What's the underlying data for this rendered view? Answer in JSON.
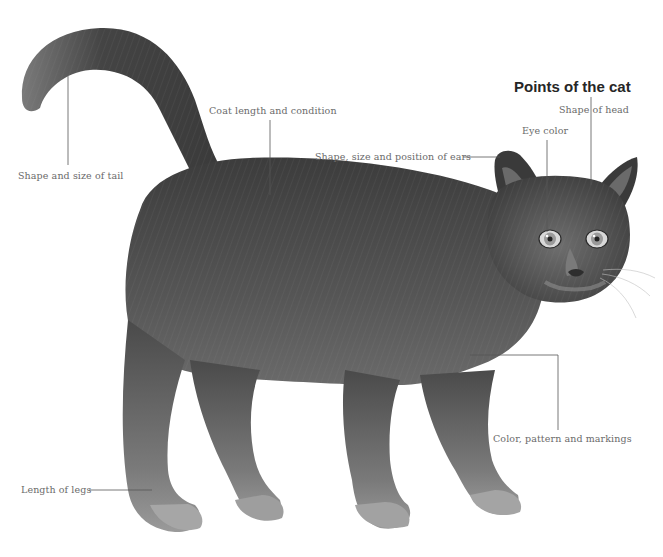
{
  "title": "Points of the cat",
  "labels": {
    "head": "Shape of head",
    "eye": "Eye color",
    "ears": "Shape, size and position of ears",
    "coat": "Coat length and condition",
    "tail": "Shape and size of tail",
    "color": "Color, pattern and markings",
    "legs": "Length of legs"
  },
  "colors": {
    "fur_dark": "#3a3a3a",
    "fur_mid": "#5a5a5a",
    "fur_light": "#8a8a8a",
    "leader_line": "#555555",
    "label_text": "#6a6a6a",
    "title_text": "#262626"
  }
}
